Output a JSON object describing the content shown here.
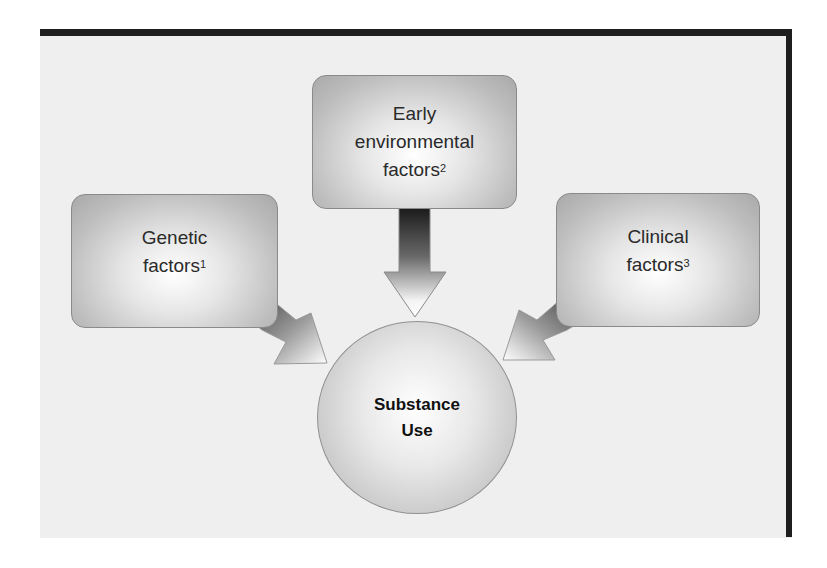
{
  "diagram": {
    "type": "influence-diagram",
    "nodes": [
      {
        "id": "early",
        "label_lines": [
          "Early",
          "environmental",
          "factors"
        ],
        "superscript": "2"
      },
      {
        "id": "genetic",
        "label_lines": [
          "Genetic",
          "factors"
        ],
        "superscript": "1"
      },
      {
        "id": "clinical",
        "label_lines": [
          "Clinical",
          "factors"
        ],
        "superscript": "3"
      }
    ],
    "center": {
      "id": "substance-use",
      "label_lines": [
        "Substance",
        "Use"
      ]
    },
    "edges": [
      {
        "from": "early",
        "to": "substance-use"
      },
      {
        "from": "genetic",
        "to": "substance-use"
      },
      {
        "from": "clinical",
        "to": "substance-use"
      }
    ]
  },
  "colors": {
    "frame": "#1e1e1e",
    "panel": "#efefef",
    "node_border": "#8a8a8a",
    "text": "#2a2a2a"
  }
}
